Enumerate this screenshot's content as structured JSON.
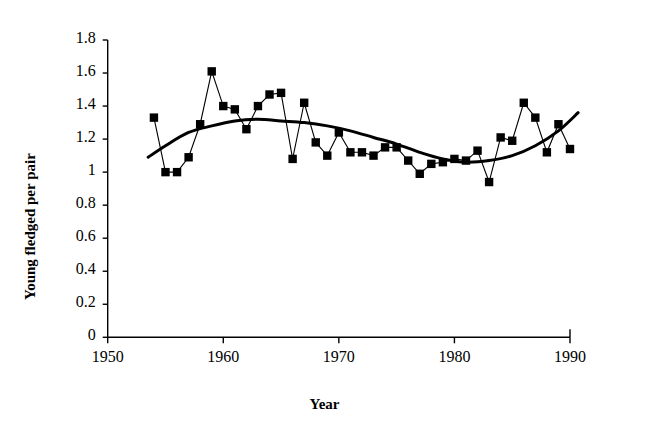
{
  "chart_data": {
    "type": "line",
    "title": "",
    "xlabel": "Year",
    "ylabel": "Young fledged per pair",
    "xlim": [
      1950,
      1990
    ],
    "ylim": [
      0,
      1.8
    ],
    "xticks": [
      1950,
      1960,
      1970,
      1980,
      1990
    ],
    "yticks": [
      0,
      0.2,
      0.4,
      0.6,
      0.8,
      1,
      1.2,
      1.4,
      1.6,
      1.8
    ],
    "ytick_labels": [
      "0",
      "0.2",
      "0.4",
      "0.6",
      "0.8",
      "1",
      "1.2",
      "1.4",
      "1.6",
      "1.8"
    ],
    "xtick_labels": [
      "1950",
      "1960",
      "1970",
      "1980",
      "1990"
    ],
    "grid": false,
    "legend": null,
    "series": [
      {
        "name": "Young fledged per pair",
        "marker": "filled-square",
        "color": "#000000",
        "x": [
          1954,
          1955,
          1956,
          1957,
          1958,
          1959,
          1960,
          1961,
          1962,
          1963,
          1964,
          1965,
          1966,
          1967,
          1968,
          1969,
          1970,
          1971,
          1972,
          1973,
          1974,
          1975,
          1976,
          1977,
          1978,
          1979,
          1980,
          1981,
          1982,
          1983,
          1984,
          1985,
          1986,
          1987,
          1988,
          1989,
          1990
        ],
        "values": [
          1.33,
          1.0,
          1.0,
          1.09,
          1.29,
          1.61,
          1.4,
          1.38,
          1.26,
          1.4,
          1.47,
          1.48,
          1.08,
          1.42,
          1.18,
          1.1,
          1.24,
          1.12,
          1.12,
          1.1,
          1.15,
          1.15,
          1.07,
          0.99,
          1.05,
          1.06,
          1.08,
          1.07,
          1.13,
          0.94,
          1.21,
          1.19,
          1.42,
          1.33,
          1.12,
          1.29,
          1.14
        ]
      },
      {
        "name": "fitted trend",
        "marker": "none",
        "color": "#000000",
        "x": [
          1953.5,
          1955,
          1957,
          1959,
          1961,
          1963,
          1965,
          1967,
          1969,
          1971,
          1973,
          1975,
          1977,
          1979,
          1981,
          1983,
          1985,
          1987,
          1989,
          1990.7
        ],
        "values": [
          1.09,
          1.16,
          1.24,
          1.28,
          1.31,
          1.32,
          1.31,
          1.3,
          1.28,
          1.25,
          1.21,
          1.17,
          1.12,
          1.08,
          1.06,
          1.07,
          1.1,
          1.16,
          1.25,
          1.36
        ]
      }
    ]
  }
}
